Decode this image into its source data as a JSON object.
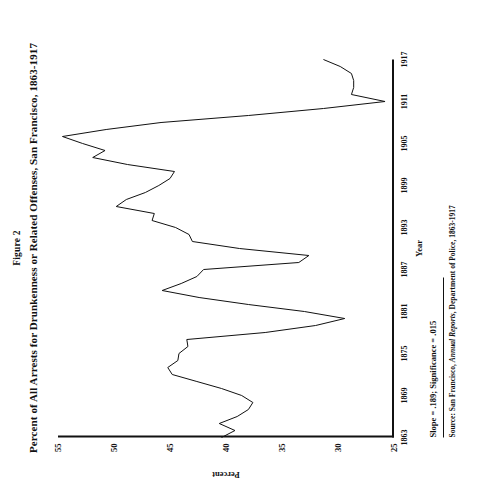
{
  "figure": {
    "number": "Figure 2",
    "title": "Percent of All Arrests for Drunkenness or Related Offenses, San Francisco, 1863-1917",
    "slope_note": "Slope = .189; Significance = .015",
    "source_prefix": "Source:",
    "source_text_a": "San Francisco, ",
    "source_text_b": "Annual Reports",
    "source_text_c": ", Department of Police, 1863-1917"
  },
  "chart_data": {
    "type": "line",
    "title": "Percent of All Arrests for Drunkenness or Related Offenses, San Francisco, 1863-1917",
    "xlabel": "Year",
    "ylabel": "Percent",
    "xlim": [
      1863,
      1917
    ],
    "ylim": [
      25,
      55
    ],
    "xticks": [
      "1863",
      "1869",
      "1875",
      "1881",
      "1887",
      "1893",
      "1899",
      "1905",
      "1911",
      "1917"
    ],
    "yticks": [
      "25",
      "30",
      "35",
      "40",
      "45",
      "50",
      "55"
    ],
    "grid": false,
    "legend": null,
    "orientation": "rotated-90-ccw",
    "line_color": "#111111",
    "x": [
      1863,
      1864,
      1865,
      1866,
      1867,
      1868,
      1869,
      1870,
      1871,
      1872,
      1873,
      1874,
      1875,
      1876,
      1877,
      1878,
      1879,
      1880,
      1881,
      1882,
      1883,
      1884,
      1885,
      1886,
      1887,
      1888,
      1889,
      1890,
      1891,
      1892,
      1893,
      1894,
      1895,
      1896,
      1897,
      1898,
      1899,
      1900,
      1901,
      1902,
      1903,
      1904,
      1905,
      1906,
      1907,
      1908,
      1909,
      1910,
      1911,
      1912,
      1913,
      1914,
      1915,
      1916,
      1917
    ],
    "y": [
      40.4,
      39.2,
      40.6,
      39.0,
      38.0,
      37.6,
      38.6,
      40.4,
      42.6,
      44.8,
      45.2,
      44.3,
      44.2,
      43.4,
      43.5,
      36.5,
      32.0,
      29.4,
      33.0,
      38.0,
      42.4,
      45.7,
      44.0,
      42.6,
      42.0,
      33.5,
      32.6,
      38.8,
      43.0,
      43.3,
      44.5,
      46.6,
      46.4,
      49.8,
      48.9,
      47.2,
      46.0,
      45.0,
      44.6,
      48.8,
      51.9,
      50.8,
      52.8,
      54.6,
      50.7,
      45.8,
      38.0,
      31.3,
      25.8,
      28.8,
      28.6,
      28.6,
      28.8,
      29.8,
      31.3
    ],
    "max_point": {
      "year": 1906,
      "value": 54.6
    },
    "min_point": {
      "year": 1911,
      "value": 25.8
    }
  }
}
